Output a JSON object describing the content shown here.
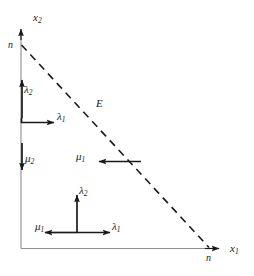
{
  "figure": {
    "kind": "mathematical-diagram",
    "background_color": "#ffffff",
    "ink_color": "#1a1a1a",
    "axis_color": "#8a8a8a"
  },
  "axes": {
    "y_axis": {
      "label_base": "x",
      "label_sub": "2",
      "tick_label": "n"
    },
    "x_axis": {
      "label_base": "x",
      "label_sub": "1",
      "tick_label": "n"
    }
  },
  "boundary": {
    "name": "E",
    "label": "E",
    "style": "dashed"
  },
  "vectors": [
    {
      "id": "left-lambda2",
      "base": "λ",
      "sub": "2",
      "direction": "up"
    },
    {
      "id": "left-lambda1",
      "base": "λ",
      "sub": "1",
      "direction": "right"
    },
    {
      "id": "left-mu2",
      "base": "μ",
      "sub": "2",
      "direction": "down"
    },
    {
      "id": "mid-mu1",
      "base": "μ",
      "sub": "1",
      "direction": "left"
    },
    {
      "id": "bottom-lambda2",
      "base": "λ",
      "sub": "2",
      "direction": "up"
    },
    {
      "id": "bottom-mu1",
      "base": "μ",
      "sub": "1",
      "direction": "left"
    },
    {
      "id": "bottom-lambda1",
      "base": "λ",
      "sub": "1",
      "direction": "right"
    }
  ]
}
